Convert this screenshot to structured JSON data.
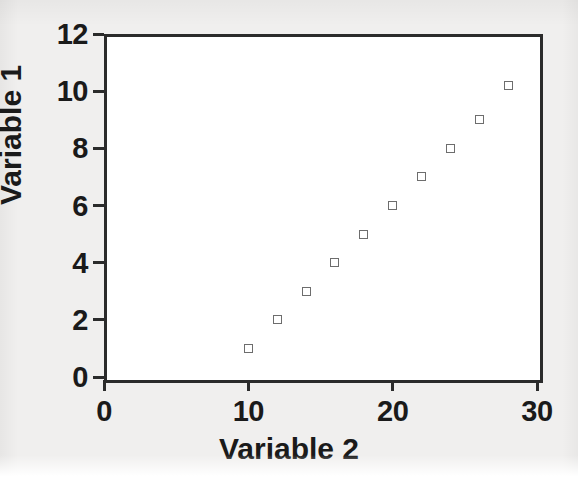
{
  "chart_data": {
    "type": "scatter",
    "title": "",
    "xlabel": "Variable 2",
    "ylabel": "Variable 1",
    "xlim": [
      0,
      30
    ],
    "ylim": [
      0,
      12
    ],
    "xticks": [
      "0",
      "10",
      "20",
      "30"
    ],
    "xtick_values": [
      0,
      10,
      20,
      30
    ],
    "yticks": [
      "0",
      "2",
      "4",
      "6",
      "8",
      "10",
      "12"
    ],
    "ytick_values": [
      0,
      2,
      4,
      6,
      8,
      10,
      12
    ],
    "grid": false,
    "legend": null,
    "series": [
      {
        "name": "",
        "marker": "open-square",
        "marker_color": "#6d6d6d",
        "points": [
          {
            "x": 10,
            "y": 1
          },
          {
            "x": 12,
            "y": 2
          },
          {
            "x": 14,
            "y": 3
          },
          {
            "x": 16,
            "y": 4
          },
          {
            "x": 18,
            "y": 5
          },
          {
            "x": 20,
            "y": 6
          },
          {
            "x": 22,
            "y": 7
          },
          {
            "x": 24,
            "y": 8
          },
          {
            "x": 26,
            "y": 9
          },
          {
            "x": 28,
            "y": 10.2
          }
        ]
      }
    ]
  },
  "style": {
    "page_background": "#f0efee",
    "plot_background": "#ffffff",
    "axis_color": "#2b2b2b",
    "text_color": "#1a1a1a",
    "marker_edge_color": "#6d6d6d"
  }
}
